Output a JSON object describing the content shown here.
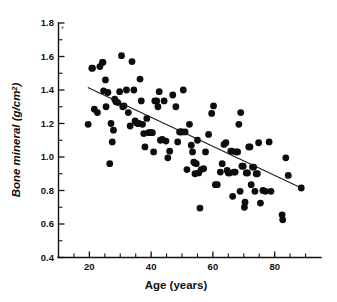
{
  "chart_data": {
    "type": "scatter",
    "title": "",
    "xlabel": "Age (years)",
    "ylabel": "Bone mineral (g/cm2)",
    "ylabel_text": "Bone mineral (g/cm",
    "ylabel_sup": "2",
    "ylabel_tail": ")",
    "xlim": [
      10,
      95
    ],
    "ylim": [
      0.4,
      1.8
    ],
    "x_ticks_major": [
      20,
      40,
      60,
      80
    ],
    "x_ticks_major_labels": [
      "20",
      "40",
      "60",
      "80"
    ],
    "x_ticks_minor": [
      10,
      15,
      25,
      30,
      35,
      45,
      50,
      55,
      65,
      70,
      75,
      85,
      90
    ],
    "y_ticks_major": [
      0.4,
      0.6,
      0.8,
      1.0,
      1.2,
      1.4,
      1.6,
      1.8
    ],
    "y_ticks_major_labels": [
      "0.4",
      "0.6",
      "0.8",
      "1.0",
      "1.2",
      "1.4",
      "1.6",
      "1.8"
    ],
    "y_ticks_minor": [
      0.5,
      0.7,
      0.9,
      1.1,
      1.3,
      1.5,
      1.7
    ],
    "grid": false,
    "legend": null,
    "marker": "filled-circle",
    "marker_color": "#0d0d0d",
    "marker_size_px": 3.4,
    "fit_line": {
      "label": "least-squares regression line",
      "x_start": 19.5,
      "y_start": 1.415,
      "x_end": 89.0,
      "y_end": 0.812,
      "color": "#1a1a1a"
    },
    "points": [
      [
        19.6,
        1.195
      ],
      [
        20.8,
        1.53
      ],
      [
        21.0,
        1.53
      ],
      [
        21.6,
        1.285
      ],
      [
        22.6,
        1.265
      ],
      [
        23.4,
        1.54
      ],
      [
        24.2,
        1.565
      ],
      [
        24.4,
        1.565
      ],
      [
        24.6,
        1.395
      ],
      [
        25.2,
        1.46
      ],
      [
        25.4,
        1.3
      ],
      [
        26.0,
        1.385
      ],
      [
        26.6,
        0.96
      ],
      [
        27.0,
        1.2
      ],
      [
        27.4,
        1.09
      ],
      [
        27.8,
        1.16
      ],
      [
        28.2,
        1.345
      ],
      [
        28.6,
        1.33
      ],
      [
        29.2,
        1.325
      ],
      [
        29.8,
        1.39
      ],
      [
        30.4,
        1.605
      ],
      [
        30.8,
        1.3
      ],
      [
        31.2,
        1.305
      ],
      [
        32.0,
        1.4
      ],
      [
        32.6,
        1.265
      ],
      [
        33.2,
        1.185
      ],
      [
        33.8,
        1.57
      ],
      [
        34.4,
        1.4
      ],
      [
        34.8,
        1.215
      ],
      [
        35.2,
        1.205
      ],
      [
        35.6,
        1.2
      ],
      [
        36.0,
        1.2
      ],
      [
        36.4,
        1.465
      ],
      [
        36.8,
        1.335
      ],
      [
        37.2,
        1.195
      ],
      [
        37.6,
        1.14
      ],
      [
        38.0,
        1.06
      ],
      [
        38.6,
        1.23
      ],
      [
        39.2,
        1.145
      ],
      [
        39.6,
        1.145
      ],
      [
        40.0,
        1.145
      ],
      [
        40.4,
        1.145
      ],
      [
        40.8,
        1.03
      ],
      [
        41.2,
        1.335
      ],
      [
        41.8,
        1.335
      ],
      [
        42.2,
        1.3
      ],
      [
        42.6,
        1.39
      ],
      [
        43.0,
        1.1
      ],
      [
        43.6,
        1.105
      ],
      [
        44.2,
        1.335
      ],
      [
        44.8,
        1.095
      ],
      [
        45.4,
        0.995
      ],
      [
        46.0,
        1.035
      ],
      [
        47.0,
        1.37
      ],
      [
        48.0,
        1.3
      ],
      [
        48.6,
        1.09
      ],
      [
        49.2,
        1.15
      ],
      [
        49.6,
        1.15
      ],
      [
        50.0,
        1.15
      ],
      [
        50.4,
        1.4
      ],
      [
        51.0,
        1.15
      ],
      [
        51.6,
        0.925
      ],
      [
        52.4,
        1.195
      ],
      [
        53.0,
        1.07
      ],
      [
        53.4,
        1.03
      ],
      [
        53.8,
        0.97
      ],
      [
        54.0,
        0.965
      ],
      [
        54.2,
        0.9
      ],
      [
        54.6,
        0.96
      ],
      [
        55.0,
        1.1
      ],
      [
        55.4,
        0.905
      ],
      [
        55.8,
        0.695
      ],
      [
        56.2,
        0.925
      ],
      [
        57.0,
        0.93
      ],
      [
        57.6,
        1.03
      ],
      [
        58.6,
        1.135
      ],
      [
        59.6,
        1.26
      ],
      [
        60.2,
        1.305
      ],
      [
        60.8,
        0.835
      ],
      [
        61.4,
        0.835
      ],
      [
        62.4,
        0.91
      ],
      [
        63.0,
        0.96
      ],
      [
        63.6,
        1.075
      ],
      [
        64.2,
        1.085
      ],
      [
        64.6,
        0.92
      ],
      [
        65.0,
        0.905
      ],
      [
        65.4,
        0.905
      ],
      [
        65.8,
        1.035
      ],
      [
        66.2,
        1.035
      ],
      [
        66.4,
        0.765
      ],
      [
        66.8,
        0.91
      ],
      [
        67.2,
        0.91
      ],
      [
        67.6,
        1.03
      ],
      [
        68.0,
        1.03
      ],
      [
        68.4,
        1.195
      ],
      [
        68.8,
        0.795
      ],
      [
        69.0,
        1.265
      ],
      [
        69.4,
        0.945
      ],
      [
        69.8,
        0.945
      ],
      [
        70.2,
        0.7
      ],
      [
        70.4,
        0.73
      ],
      [
        70.8,
        0.905
      ],
      [
        71.2,
        0.905
      ],
      [
        71.6,
        1.06
      ],
      [
        72.0,
        1.06
      ],
      [
        72.4,
        0.835
      ],
      [
        72.8,
        0.94
      ],
      [
        73.2,
        0.94
      ],
      [
        73.6,
        0.795
      ],
      [
        74.0,
        0.9
      ],
      [
        74.4,
        0.9
      ],
      [
        74.8,
        1.085
      ],
      [
        75.4,
        0.725
      ],
      [
        76.2,
        0.8
      ],
      [
        77.0,
        0.795
      ],
      [
        78.2,
        1.09
      ],
      [
        78.8,
        0.795
      ],
      [
        82.4,
        0.655
      ],
      [
        82.6,
        0.625
      ],
      [
        83.6,
        0.995
      ],
      [
        84.4,
        0.89
      ],
      [
        88.6,
        0.815
      ]
    ],
    "n_points": 122
  }
}
